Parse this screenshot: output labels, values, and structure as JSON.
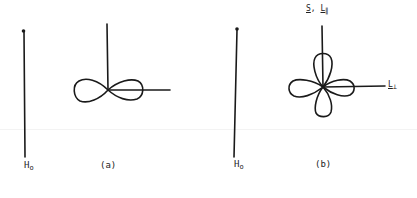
{
  "figure": {
    "panels": [
      {
        "id": "a",
        "caption": "(a)",
        "field_axis_label": "H",
        "field_axis_subscript": "o",
        "orbital_shape": "two-lobe (figure-eight) along horizontal axis"
      },
      {
        "id": "b",
        "caption": "(b)",
        "field_axis_label": "H",
        "field_axis_subscript": "o",
        "orbital_shape": "four-lobe (cloverleaf)",
        "vertical_axis_label_s": "S",
        "vertical_axis_label_sep": ",",
        "vertical_axis_label_l": "L",
        "vertical_axis_label_l_sub": "∥",
        "horizontal_axis_label": "L",
        "horizontal_axis_label_sub": "⊥"
      }
    ]
  },
  "colors": {
    "ink": "#1a1a1a",
    "background": "#ffffff"
  }
}
